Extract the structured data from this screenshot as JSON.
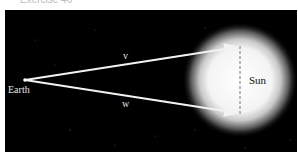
{
  "caption": "Exercise 46",
  "diagram": {
    "labels": {
      "earth": "Earth",
      "sun": "Sun",
      "vector_v": "v",
      "vector_w": "w"
    },
    "colors": {
      "background": "#000000",
      "vectors": "#f2f2f2",
      "sun_core": "#ffffff",
      "dashed_line": "#777777"
    }
  }
}
